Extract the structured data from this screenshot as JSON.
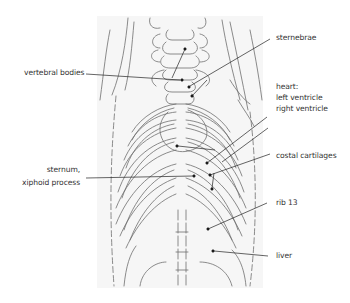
{
  "diagram": {
    "type": "anatomical-illustration",
    "colors": {
      "background": "#ffffff",
      "drawing_background": "#f6f6f6",
      "line_art": "#6a6a6a",
      "leader_line": "#222222",
      "label_text": "#333333"
    },
    "labels": {
      "vertebral_bodies": "vertebral bodies",
      "sternebrae": "sternebrae",
      "heart_title": "heart:",
      "left_ventricle": "left ventricle",
      "right_ventricle": "right ventricle",
      "costal_cartilages": "costal cartilages",
      "sternum_line1": "sternum,",
      "sternum_line2": "xiphoid process",
      "rib13": "rib 13",
      "liver": "liver"
    }
  }
}
